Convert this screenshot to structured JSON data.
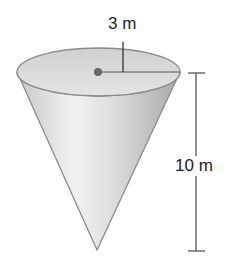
{
  "figure": {
    "type": "cone",
    "radius_label": "3 m",
    "height_label": "10 m",
    "radius_value": 3,
    "height_value": 10,
    "unit": "m",
    "colors": {
      "cone_light": "#f4f4f4",
      "cone_dark": "#b9b9b9",
      "rim_fill": "#d8d8d8",
      "outline": "#8a8a8a",
      "line": "#333333",
      "center_dot": "#666666"
    }
  }
}
